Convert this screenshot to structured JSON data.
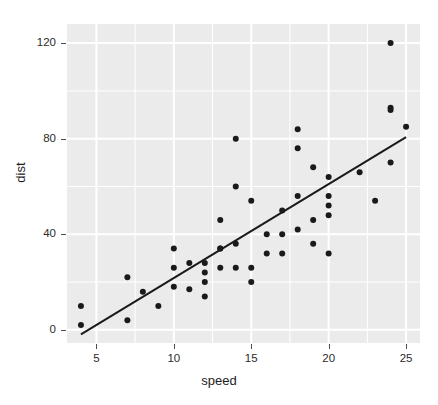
{
  "chart_data": {
    "type": "scatter",
    "title": "",
    "xlabel": "speed",
    "ylabel": "dist",
    "xlim": [
      3.1,
      25.9
    ],
    "ylim": [
      -5.5,
      128
    ],
    "xticks": [
      5,
      10,
      15,
      20,
      25
    ],
    "yticks": [
      0,
      40,
      80,
      120
    ],
    "x_minor_ticks": [
      7.5,
      12.5,
      17.5,
      22.5
    ],
    "y_minor_ticks": [
      20,
      60,
      100
    ],
    "grid": true,
    "legend": "none",
    "x": [
      4,
      4,
      7,
      7,
      8,
      9,
      10,
      10,
      10,
      11,
      11,
      12,
      12,
      12,
      12,
      13,
      13,
      13,
      13,
      14,
      14,
      14,
      14,
      15,
      15,
      15,
      16,
      16,
      17,
      17,
      17,
      18,
      18,
      18,
      18,
      19,
      19,
      19,
      20,
      20,
      20,
      20,
      20,
      22,
      23,
      24,
      24,
      24,
      24,
      25
    ],
    "y": [
      2,
      10,
      4,
      22,
      16,
      10,
      18,
      26,
      34,
      17,
      28,
      14,
      20,
      24,
      28,
      26,
      34,
      34,
      46,
      26,
      36,
      60,
      80,
      20,
      26,
      54,
      32,
      40,
      32,
      40,
      50,
      42,
      56,
      76,
      84,
      36,
      46,
      68,
      32,
      48,
      52,
      56,
      64,
      66,
      54,
      70,
      92,
      93,
      120,
      85
    ],
    "series": [
      {
        "name": "observations",
        "marker": "filled-circle",
        "color": "#1a1a1a",
        "size": 6
      },
      {
        "name": "linear-fit",
        "type": "line",
        "color": "#1a1a1a",
        "width": 2,
        "endpoints": [
          [
            4,
            -1.85
          ],
          [
            25,
            80.7
          ]
        ],
        "equation": "dist = -17.58 + 3.93 * speed"
      }
    ],
    "panel_background": "#ebebeb",
    "gridline_color": "#ffffff",
    "n_points": 50
  },
  "axis": {
    "y_title": "dist",
    "x_title": "speed",
    "y_tick_labels": [
      "120",
      "80",
      "40",
      "0"
    ],
    "x_tick_labels": [
      "5",
      "10",
      "15",
      "20",
      "25"
    ]
  }
}
